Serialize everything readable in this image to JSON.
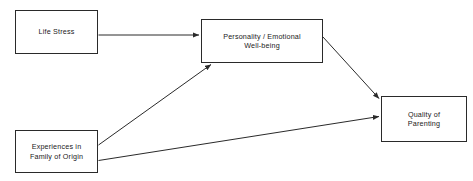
{
  "diagram": {
    "type": "path-model",
    "nodes": [
      {
        "id": "life-stress",
        "label": "Life Stress"
      },
      {
        "id": "personality",
        "label": "Personality / Emotional\nWell-being"
      },
      {
        "id": "quality-parenting",
        "label": "Quality of\nParenting"
      },
      {
        "id": "experiences",
        "label": "Experiences in\nFamily of Origin"
      }
    ],
    "edges": [
      {
        "id": "life-stress-to-personality",
        "from": "life-stress",
        "to": "personality",
        "style": "straight-arrow"
      },
      {
        "id": "experiences-to-personality",
        "from": "experiences",
        "to": "personality",
        "style": "diagonal-arrow"
      },
      {
        "id": "personality-to-quality-parenting",
        "from": "personality",
        "to": "quality-parenting",
        "style": "diagonal-arrow"
      },
      {
        "id": "experiences-to-quality-parenting",
        "from": "experiences",
        "to": "quality-parenting",
        "style": "diagonal-arrow"
      }
    ],
    "colors": {
      "background": "#ffffff",
      "node_border": "#2a2a2a",
      "node_fill": "#ffffff",
      "text": "#1a1a1a",
      "edge": "#2a2a2a"
    }
  }
}
